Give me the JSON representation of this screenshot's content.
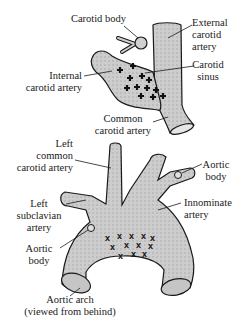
{
  "top_diagram": {
    "labels": {
      "carotid_body": "Carotid body",
      "external_carotid": [
        "External",
        "carotid",
        "artery"
      ],
      "internal_carotid": [
        "Internal",
        "carotid artery"
      ],
      "carotid_sinus": [
        "Carotid",
        "sinus"
      ],
      "common_carotid": [
        "Common",
        "carotid artery"
      ]
    },
    "receptor_marker": "+"
  },
  "bottom_diagram": {
    "labels": {
      "left_common_carotid": [
        "Left",
        "common",
        "carotid artery"
      ],
      "aortic_body_right": [
        "Aortic",
        "body"
      ],
      "left_subclavian": [
        "Left",
        "subclavian",
        "artery"
      ],
      "innominate": [
        "Innominate",
        "artery"
      ],
      "aortic_body_left": [
        "Aortic",
        "body"
      ],
      "aortic_arch": [
        "Aortic arch",
        "(viewed from behind)"
      ]
    },
    "receptor_marker": "x"
  },
  "colors": {
    "vessel_fill": "#c8c8c8",
    "stroke": "#1a1a1a",
    "text": "#1a1a1a"
  }
}
